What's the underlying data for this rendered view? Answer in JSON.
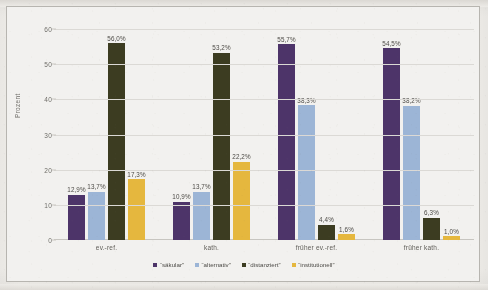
{
  "chart_data": {
    "type": "bar",
    "title": "",
    "subtitle": "",
    "xlabel": "",
    "ylabel": "Prozent",
    "ylim": [
      0,
      62
    ],
    "yticks": [
      0,
      10,
      20,
      30,
      40,
      50,
      60
    ],
    "ytick_labels": [
      "0",
      "10",
      "20",
      "30",
      "40",
      "50",
      "60"
    ],
    "grid": true,
    "legend_position": "bottom",
    "value_suffix": "%",
    "decimal_separator": ",",
    "categories": [
      "ev.-ref.",
      "kath.",
      "früher ev.-ref.",
      "früher kath."
    ],
    "series": [
      {
        "name": "“säkular”",
        "color": "#4B3268",
        "values": [
          12.9,
          10.9,
          55.7,
          54.5
        ],
        "labels": [
          "12,9%",
          "10,9%",
          "55,7%",
          "54,5%"
        ]
      },
      {
        "name": "“alternativ”",
        "color": "#9DB7D9",
        "values": [
          13.7,
          13.7,
          38.3,
          38.2
        ],
        "labels": [
          "13,7%",
          "13,7%",
          "38,3%",
          "38,2%"
        ]
      },
      {
        "name": "“distanziert”",
        "color": "#3A3A1E",
        "values": [
          56.0,
          53.2,
          4.4,
          6.3
        ],
        "labels": [
          "56,0%",
          "53,2%",
          "4,4%",
          "6,3%"
        ]
      },
      {
        "name": "“institutionell”",
        "color": "#E8B93C",
        "values": [
          17.3,
          22.2,
          1.6,
          1.0
        ],
        "labels": [
          "17,3%",
          "22,2%",
          "1,6%",
          "1,0%"
        ]
      }
    ]
  },
  "legend": {
    "items": [
      {
        "label": "“säkular”",
        "color": "#4B3268"
      },
      {
        "label": "“alternativ”",
        "color": "#9DB7D9"
      },
      {
        "label": "“distanziert”",
        "color": "#3A3A1E"
      },
      {
        "label": "“institutionell”",
        "color": "#E8B93C"
      }
    ]
  }
}
